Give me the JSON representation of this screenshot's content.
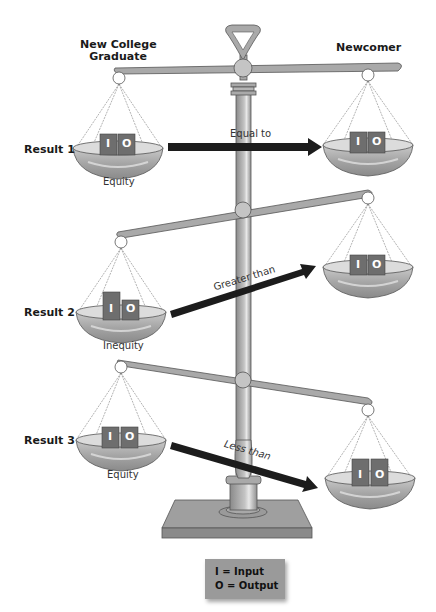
{
  "headers": {
    "left": "New College Graduate",
    "left_line1": "New College",
    "left_line2": "Graduate",
    "right": "Newcomer"
  },
  "results": [
    {
      "label": "Result 1",
      "caption": "Equity",
      "relation": "Equal to"
    },
    {
      "label": "Result 2",
      "caption": "Inequity",
      "relation": "Greater than"
    },
    {
      "label": "Result 3",
      "caption": "Equity",
      "relation": "Less than"
    }
  ],
  "block_letters": {
    "input": "I",
    "output": "O"
  },
  "legend": {
    "line1": "I = Input",
    "line2": "O = Output"
  },
  "colors": {
    "metal": "#a9a9a9",
    "metal_dark": "#7d7d7d",
    "metal_light": "#d4d4d4",
    "block": "#6e6e6e",
    "arrow": "#1c1c1c",
    "legend_bg": "#9a9a9a"
  }
}
